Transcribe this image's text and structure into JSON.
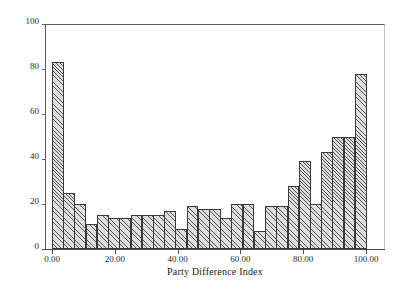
{
  "chart_data": {
    "type": "bar",
    "title": "",
    "xlabel": "Party Difference Index",
    "ylabel": "",
    "xlim": [
      0,
      100
    ],
    "ylim": [
      0,
      100
    ],
    "grid": false,
    "legend": null,
    "bin_width": 3.5714,
    "x_tick_labels": [
      "0.00",
      "20.00",
      "40.00",
      "60.00",
      "80.00",
      "100.00"
    ],
    "x_tick_values": [
      0,
      20,
      40,
      60,
      80,
      100
    ],
    "y_tick_labels": [
      "0",
      "20",
      "40",
      "60",
      "80",
      "100"
    ],
    "y_tick_values": [
      0,
      20,
      40,
      60,
      80,
      100
    ],
    "categories": [
      "0.0-3.6",
      "3.6-7.1",
      "7.1-10.7",
      "10.7-14.3",
      "14.3-17.9",
      "17.9-21.4",
      "21.4-25.0",
      "25.0-28.6",
      "28.6-32.1",
      "32.1-35.7",
      "35.7-39.3",
      "39.3-42.9",
      "42.9-46.4",
      "46.4-50.0",
      "50.0-53.6",
      "53.6-57.1",
      "57.1-60.7",
      "60.7-64.3",
      "64.3-67.9",
      "67.9-71.4",
      "71.4-75.0",
      "75.0-78.6",
      "78.6-82.1",
      "82.1-85.7",
      "85.7-89.3",
      "89.3-92.9",
      "92.9-96.4",
      "96.4-100.0"
    ],
    "values": [
      83,
      25,
      20,
      11,
      15,
      14,
      14,
      15,
      15,
      15,
      17,
      9,
      19,
      18,
      18,
      14,
      20,
      20,
      8,
      19,
      19,
      28,
      39,
      20,
      43,
      50,
      50,
      78
    ]
  }
}
